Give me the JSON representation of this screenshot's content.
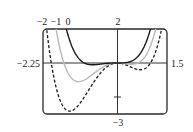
{
  "chart_data": {
    "type": "line",
    "title": "",
    "xlabel": "",
    "ylabel": "",
    "xlim": [
      -2.25,
      1.5
    ],
    "ylim": [
      -3,
      2
    ],
    "grid": false,
    "axis_labels": {
      "x_min": "−2.25",
      "x_max": "1.5",
      "y_max": "2",
      "y_min": "−3"
    },
    "y_ticks": [
      -2
    ],
    "series": [
      {
        "name": "c = −2",
        "label": "−2",
        "formula": "x^4 + x^3 - 2x^2",
        "coeffs": [
          1,
          1,
          -2
        ],
        "style": "dashed",
        "color": "#1a1a1a",
        "key_points": {
          "local_min_left": [
            -1.44,
            -2.83
          ],
          "local_max": [
            0,
            0
          ],
          "local_min_right": [
            0.69,
            -0.4
          ],
          "roots": [
            -2,
            0,
            1
          ]
        }
      },
      {
        "name": "c = −1",
        "label": "−1",
        "formula": "x^4 + x^3 - x^2",
        "coeffs": [
          1,
          1,
          -1
        ],
        "style": "solid",
        "color": "#b8b8b8",
        "key_points": {
          "local_min_left": [
            -1.18,
            -1.1
          ],
          "local_max": [
            0,
            0
          ],
          "local_min_right": [
            0.43,
            -0.08
          ],
          "roots": [
            -1.62,
            0,
            0.62
          ]
        }
      },
      {
        "name": "c = 0",
        "label": "0",
        "formula": "x^4 + x^3",
        "coeffs": [
          1,
          1,
          0
        ],
        "style": "solid",
        "color": "#1a1a1a",
        "key_points": {
          "min": [
            -0.75,
            -0.105
          ],
          "roots": [
            -1,
            0
          ]
        }
      }
    ]
  }
}
